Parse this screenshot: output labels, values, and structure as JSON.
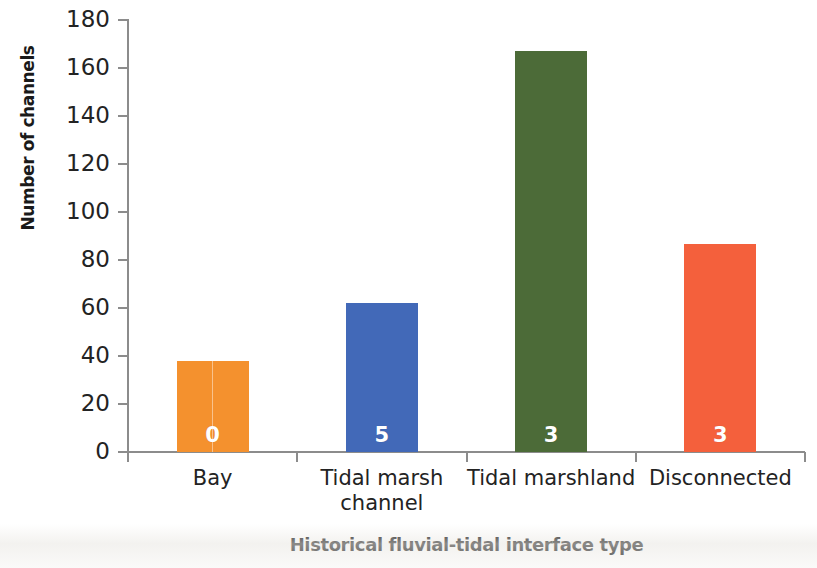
{
  "chart_data": {
    "type": "bar",
    "title": "",
    "subtitle": "",
    "xlabel": "Historical fluvial-tidal interface type",
    "ylabel": "Number of channels",
    "categories": [
      "Bay",
      "Tidal marsh channel",
      "Tidal marshland",
      "Disconnected"
    ],
    "category_lines": [
      [
        "Bay"
      ],
      [
        "Tidal marsh",
        "channel"
      ],
      [
        "Tidal marshland"
      ],
      [
        "Disconnected"
      ]
    ],
    "values": [
      38,
      62,
      167,
      86.5
    ],
    "bar_labels": [
      "0",
      "5",
      "3",
      "3"
    ],
    "colors": [
      "#F4912E",
      "#4269B8",
      "#4C6B38",
      "#F4603C"
    ],
    "ylim": [
      0,
      180
    ],
    "yticks": [
      0,
      20,
      40,
      60,
      80,
      100,
      120,
      140,
      160,
      180
    ],
    "ytick_labels": [
      "0",
      "20",
      "40",
      "60",
      "80",
      "100",
      "120",
      "140",
      "160",
      "180"
    ],
    "grid": false,
    "legend": null,
    "legend_position": "none",
    "axis_color": "#8c8c8c",
    "text_color": "#232323"
  },
  "figure": {
    "background": "#ffffff"
  }
}
